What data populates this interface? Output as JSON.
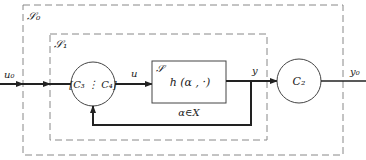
{
  "diagram": {
    "outer_system": {
      "label": "𝒮₀"
    },
    "inner_system": {
      "label": "𝒮₁"
    },
    "controller_block": {
      "label": "[C₃ ⋮ C₄]"
    },
    "plant_block": {
      "label": "𝒮",
      "function": "h (α , ·)",
      "constraint": "α∈X"
    },
    "output_block": {
      "label": "C₂"
    },
    "signals": {
      "input": "u₀",
      "control": "u",
      "plant_output": "y",
      "final_output": "y₀"
    }
  },
  "colors": {
    "line": "#222222",
    "dashed": "#777777",
    "background": "#ffffff"
  }
}
